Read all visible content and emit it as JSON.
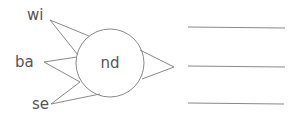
{
  "diagram": {
    "center_label": "nd",
    "left_labels": [
      {
        "text": "wi"
      },
      {
        "text": "ba"
      },
      {
        "text": "se"
      }
    ],
    "answer_lines_count": 3,
    "colors": {
      "stroke": "#8a8a8a",
      "text": "#555555",
      "background": "#ffffff"
    }
  }
}
